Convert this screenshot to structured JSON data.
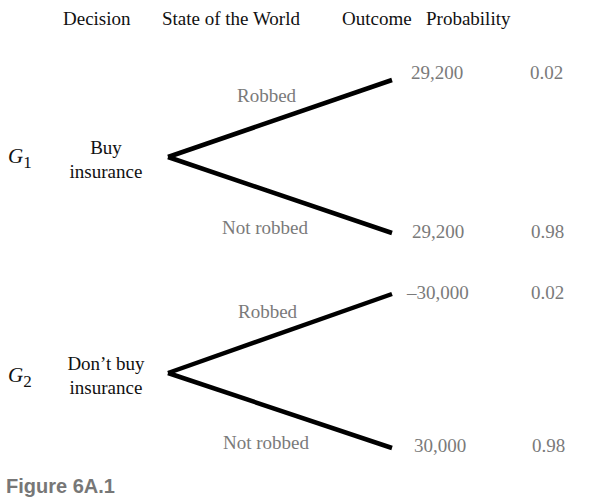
{
  "headers": {
    "decision": "Decision",
    "state": "State of the World",
    "outcome": "Outcome",
    "probability": "Probability"
  },
  "gambles": [
    {
      "id": "G",
      "sub": "1",
      "decision_line1": "Buy",
      "decision_line2": "insurance",
      "branches": [
        {
          "state": "Robbed",
          "outcome": "29,200",
          "probability": "0.02"
        },
        {
          "state": "Not robbed",
          "outcome": "29,200",
          "probability": "0.98"
        }
      ]
    },
    {
      "id": "G",
      "sub": "2",
      "decision_line1": "Don’t buy",
      "decision_line2": "insurance",
      "branches": [
        {
          "state": "Robbed",
          "outcome": "–30,000",
          "probability": "0.02"
        },
        {
          "state": "Not robbed",
          "outcome": "30,000",
          "probability": "0.98"
        }
      ]
    }
  ],
  "caption": "Figure 6A.1",
  "colors": {
    "line": "#000000",
    "label": "#7a7a7a",
    "header": "#111111"
  }
}
